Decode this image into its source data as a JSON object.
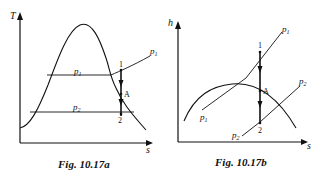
{
  "figures": [
    {
      "id": "fig-a",
      "caption": "Fig. 10.17a",
      "axes": {
        "y": "T",
        "x": "s"
      },
      "labels": {
        "p1_isobar": "p",
        "p1_sub": "1",
        "p1_end": "p",
        "p1_end_sub": "1",
        "p2_isobar": "p",
        "p2_sub": "2"
      },
      "points": {
        "start": "1",
        "mid": "A",
        "end": "2"
      }
    },
    {
      "id": "fig-b",
      "caption": "Fig. 10.17b",
      "axes": {
        "y": "h",
        "x": "s"
      },
      "labels": {
        "p1_top": "p",
        "p1_top_sub": "1",
        "p1_low": "p",
        "p1_low_sub": "1",
        "p2_top": "p",
        "p2_top_sub": "2",
        "p2_low": "p",
        "p2_low_sub": "2"
      },
      "points": {
        "start": "1",
        "mid": "A",
        "end": "2"
      }
    }
  ]
}
